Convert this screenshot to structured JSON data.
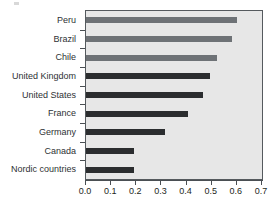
{
  "chart_data": {
    "type": "bar",
    "orientation": "horizontal",
    "title": "",
    "xlabel": "",
    "ylabel": "",
    "xlim": [
      0.0,
      0.7
    ],
    "xticks": [
      "0.0",
      "0.1",
      "0.2",
      "0.3",
      "0.4",
      "0.5",
      "0.6",
      "0.7"
    ],
    "xtick_values": [
      0.0,
      0.1,
      0.2,
      0.3,
      0.4,
      0.5,
      0.6,
      0.7
    ],
    "grid": false,
    "legend": "none",
    "categories": [
      "Peru",
      "Brazil",
      "Chile",
      "United Kingdom",
      "United States",
      "France",
      "Germany",
      "Canada",
      "Nordic countries"
    ],
    "values": [
      0.6,
      0.58,
      0.52,
      0.495,
      0.465,
      0.405,
      0.315,
      0.19,
      0.19
    ],
    "bar_colors": [
      "#6e7276",
      "#6e7276",
      "#6e7276",
      "#2b2d2f",
      "#2b2d2f",
      "#2b2d2f",
      "#2b2d2f",
      "#2b2d2f",
      "#2b2d2f"
    ],
    "plot_background": "#e7e7e7",
    "axis_color": "#4a4f53",
    "page_background": "#ffffff"
  }
}
